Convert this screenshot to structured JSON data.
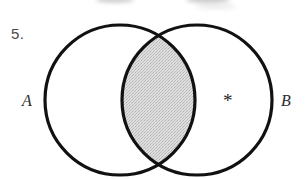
{
  "figure": {
    "type": "venn-diagram",
    "problem_number": "5.",
    "set_labels": {
      "left": "A",
      "right": "B"
    },
    "marker": "*",
    "marker_region": "B only",
    "shaded_region": "intersection",
    "shaded_region_label": "A ∩ B",
    "background_color": "#ffffff",
    "stroke_color": "#111111",
    "shade_color": "#d6d6d6",
    "shade_pattern": "halftone-dither",
    "geometry": {
      "left_circle": {
        "cx": 120,
        "cy": 100,
        "r": 75
      },
      "right_circle": {
        "cx": 197,
        "cy": 100,
        "r": 75
      },
      "stroke_width": 3.2
    }
  }
}
